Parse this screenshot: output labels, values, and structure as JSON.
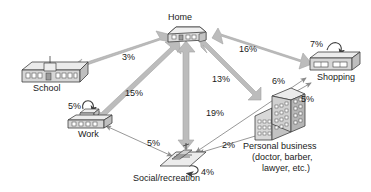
{
  "diagram": {
    "type": "node-link-flow",
    "background": "#ffffff",
    "arrow_color": "#b9b9b9",
    "arrow_stroke": "#9a9a9a",
    "thin_arrow_color": "#8c8c8c",
    "text_color": "#1a1a1a",
    "icon_fill": "#d9d9d9",
    "icon_stroke": "#4a4a4a"
  },
  "nodes": [
    {
      "id": "home",
      "label": "Home",
      "icon": "house-icon",
      "x": 185,
      "y": 30
    },
    {
      "id": "school",
      "label": "School",
      "icon": "school-building-icon",
      "x": 52,
      "y": 72
    },
    {
      "id": "work",
      "label": "Work",
      "icon": "work-building-icon",
      "x": 88,
      "y": 118
    },
    {
      "id": "social",
      "label": "Social/recreation",
      "icon": "park-bench-icon",
      "x": 185,
      "y": 163
    },
    {
      "id": "personal",
      "label": "Personal business",
      "icon": "office-building-icon",
      "x": 278,
      "y": 118
    },
    {
      "id": "shopping",
      "label": "Shopping",
      "icon": "store-building-icon",
      "x": 324,
      "y": 62
    }
  ],
  "labels": {
    "home": "Home",
    "school": "School",
    "work": "Work",
    "social": "Social/recreation",
    "shopping": "Shopping",
    "personal_line1": "Personal business",
    "personal_line2": "(doctor, barber,",
    "personal_line3": "lawyer, etc.)"
  },
  "flows": [
    {
      "from": "home",
      "to": "school",
      "value": 3,
      "label": "3%",
      "style": "thick-double"
    },
    {
      "from": "work",
      "to": "home",
      "value": 15,
      "label": "15%",
      "style": "thick-double"
    },
    {
      "from": "social",
      "to": "home",
      "value": 19,
      "label": "19%",
      "style": "thick-double"
    },
    {
      "from": "home",
      "to": "personal",
      "value": 13,
      "label": "13%",
      "style": "thick-double"
    },
    {
      "from": "home",
      "to": "shopping",
      "value": 16,
      "label": "16%",
      "style": "thick-double"
    },
    {
      "from": "social",
      "to": "shopping",
      "value": 6,
      "label": "6%",
      "style": "thin-double"
    },
    {
      "from": "personal",
      "to": "shopping",
      "value": 5,
      "label": "5%",
      "style": "thin-double"
    },
    {
      "from": "social",
      "to": "personal",
      "value": 2,
      "label": "2%",
      "style": "thin-double"
    },
    {
      "from": "work",
      "to": "social",
      "value": 5,
      "label": "5%",
      "style": "thin-double"
    },
    {
      "from": "work",
      "to": "work",
      "value": 5,
      "label": "5%",
      "style": "self-loop"
    },
    {
      "from": "social",
      "to": "social",
      "value": 4,
      "label": "4%",
      "style": "self-loop"
    },
    {
      "from": "shopping",
      "to": "shopping",
      "value": 7,
      "label": "7%",
      "style": "self-loop"
    }
  ],
  "percent_labels": {
    "p_school": "3%",
    "p_work_home": "15%",
    "p_social_home": "19%",
    "p_personal_home": "13%",
    "p_shopping_home": "16%",
    "p_social_shopping": "6%",
    "p_personal_shopping": "5%",
    "p_social_personal": "2%",
    "p_work_social": "5%",
    "p_work_loop": "5%",
    "p_social_loop": "4%",
    "p_shopping_loop": "7%"
  }
}
